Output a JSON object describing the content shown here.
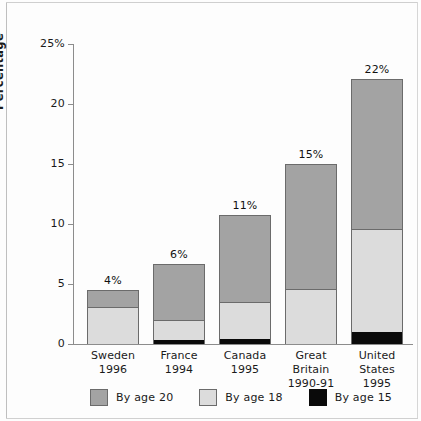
{
  "chart_data": {
    "type": "bar",
    "subtype": "stacked-vertical",
    "title": "",
    "xlabel": "",
    "ylabel": "Percentage",
    "ylim": [
      0,
      25
    ],
    "yticks": [
      0,
      5,
      10,
      15,
      20,
      25
    ],
    "ytick_labels": [
      "0",
      "5",
      "10",
      "15",
      "20",
      "25%"
    ],
    "grid": false,
    "legend_position": "bottom",
    "categories": [
      "Sweden",
      "France",
      "Canada",
      "Great Britain",
      "United States"
    ],
    "category_years": [
      "1996",
      "1994",
      "1995",
      "1990-91",
      "1995"
    ],
    "series": [
      {
        "name": "By age 15",
        "color": "#0a0a0a",
        "values": [
          0.0,
          0.3,
          0.4,
          0.0,
          1.0
        ]
      },
      {
        "name": "By age 18",
        "color": "#dcdcdc",
        "values": [
          3.0,
          1.6,
          3.0,
          4.5,
          8.5
        ]
      },
      {
        "name": "By age 20",
        "color": "#a3a3a3",
        "values": [
          1.4,
          4.7,
          7.3,
          10.4,
          12.5
        ]
      }
    ],
    "cumulative_tops": {
      "age15": [
        0.0,
        0.3,
        0.4,
        0.0,
        1.0
      ],
      "age18": [
        3.0,
        1.9,
        3.4,
        4.5,
        9.5
      ],
      "age20": [
        4.4,
        6.6,
        10.7,
        14.9,
        22.0
      ]
    },
    "bar_labels": [
      "4%",
      "6%",
      "11%",
      "15%",
      "22%"
    ],
    "legend_entries": [
      "By age 20",
      "By age 18",
      "By age 15"
    ]
  },
  "axis": {
    "y_label": "Percentage",
    "ticks": [
      {
        "value": 25,
        "label": "25%"
      },
      {
        "value": 20,
        "label": "20"
      },
      {
        "value": 15,
        "label": "15"
      },
      {
        "value": 10,
        "label": "10"
      },
      {
        "value": 5,
        "label": "5"
      },
      {
        "value": 0,
        "label": "0"
      }
    ]
  },
  "bars": [
    {
      "country": "Sweden",
      "year": "1996",
      "label": "4%",
      "age15": 0.0,
      "age18": 3.0,
      "age20": 4.4
    },
    {
      "country": "France",
      "year": "1994",
      "label": "6%",
      "age15": 0.3,
      "age18": 1.9,
      "age20": 6.6
    },
    {
      "country": "Canada",
      "year": "1995",
      "label": "11%",
      "age15": 0.4,
      "age18": 3.4,
      "age20": 10.7
    },
    {
      "country": "Great Britain",
      "year": "1990-91",
      "label": "15%",
      "age15": 0.0,
      "age18": 4.5,
      "age20": 14.9
    },
    {
      "country": "United States",
      "year": "1995",
      "label": "22%",
      "age15": 1.0,
      "age18": 9.5,
      "age20": 22.0
    }
  ],
  "legend": [
    {
      "label": "By age 20",
      "color": "#a3a3a3"
    },
    {
      "label": "By age 18",
      "color": "#dcdcdc"
    },
    {
      "label": "By age 15",
      "color": "#0a0a0a"
    }
  ],
  "colors": {
    "age20": "#a3a3a3",
    "age18": "#dcdcdc",
    "age15": "#0a0a0a",
    "axis": "#8c8c8c",
    "outline": "#6b6b6b",
    "background": "#fdfdfd"
  }
}
